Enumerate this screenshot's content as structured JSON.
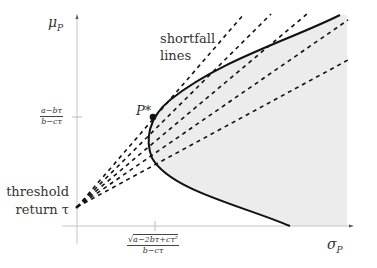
{
  "diagram": {
    "type": "mean-variance shortfall diagram",
    "axes": {
      "y_label_main": "μ",
      "y_label_sub": "P",
      "x_label_main": "σ",
      "x_label_sub": "P"
    },
    "y_tick": {
      "numerator": "a−bτ",
      "denominator": "b−cτ"
    },
    "x_tick": {
      "numerator_prefix": "√",
      "numerator": "a−2bτ+cτ²",
      "denominator": "b−cτ"
    },
    "annotations": {
      "shortfall_line1": "shortfall",
      "shortfall_line2": "lines",
      "threshold_line1": "threshold",
      "threshold_line2": "return τ",
      "point_label": "P*"
    },
    "colors": {
      "curve": "#111111",
      "dashes": "#111111",
      "shade": "#eeeeee",
      "axis": "#bbbbbb"
    }
  }
}
